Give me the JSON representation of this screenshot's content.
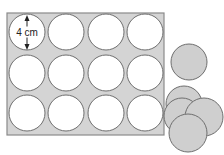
{
  "diagram": {
    "colors": {
      "sheet_fill": "#d4d4d4",
      "sheet_stroke": "#8a8a8a",
      "hole_fill": "#ffffff",
      "hole_stroke": "#6e6e6e",
      "disc_fill": "#cfcfcf",
      "disc_stroke": "#6e6e6e",
      "text": "#222222"
    },
    "sheet": {
      "x": 7,
      "y": 13,
      "width": 157,
      "height": 122,
      "rows": 3,
      "cols": 4
    },
    "holes": {
      "radius": 18,
      "col_centers": [
        27,
        66,
        106,
        145
      ],
      "row_centers": [
        32,
        73,
        113
      ]
    },
    "dimension": {
      "label": "4 cm",
      "arrow_x": 27,
      "y_top": 15,
      "y_bottom": 50
    },
    "single_disc": {
      "cx": 189,
      "cy": 62,
      "r": 18
    },
    "stacked_discs": [
      {
        "cx": 184,
        "cy": 104,
        "r": 18
      },
      {
        "cx": 182,
        "cy": 116,
        "r": 18
      },
      {
        "cx": 204,
        "cy": 117,
        "r": 19
      },
      {
        "cx": 188,
        "cy": 133,
        "r": 19
      }
    ]
  }
}
